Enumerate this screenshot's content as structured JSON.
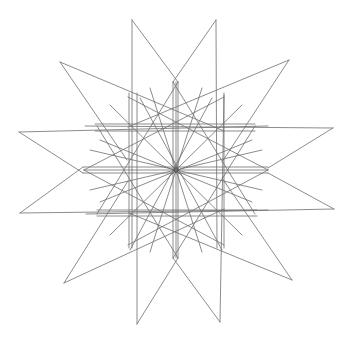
{
  "figure": {
    "width": 352,
    "height": 341,
    "background": "#ffffff",
    "stroke": "#6e6e6e",
    "stroke_dark": "#4a4a4a",
    "stroke_width": 0.8,
    "center": [
      176,
      170
    ],
    "center_circle_radius": 2.2,
    "outer_tips": [
      [
        132,
        20
      ],
      [
        216,
        20
      ],
      [
        289,
        60
      ],
      [
        333,
        128
      ],
      [
        334,
        209
      ],
      [
        292,
        280
      ],
      [
        220,
        322
      ],
      [
        137,
        324
      ],
      [
        64,
        283
      ],
      [
        20,
        213
      ],
      [
        19,
        132
      ],
      [
        60,
        62
      ]
    ],
    "lines": [
      [
        132,
        20,
        132,
        248
      ],
      [
        132,
        20,
        178,
        82
      ],
      [
        216,
        20,
        217,
        248
      ],
      [
        216,
        20,
        173,
        82
      ],
      [
        60,
        62,
        224,
        131
      ],
      [
        60,
        62,
        127,
        160
      ],
      [
        289,
        60,
        128,
        127
      ],
      [
        289,
        60,
        222,
        162
      ],
      [
        19,
        132,
        268,
        126
      ],
      [
        19,
        132,
        83,
        173
      ],
      [
        333,
        128,
        85,
        126
      ],
      [
        333,
        128,
        268,
        168
      ],
      [
        20,
        213,
        268,
        210
      ],
      [
        20,
        213,
        83,
        167
      ],
      [
        334,
        209,
        86,
        214
      ],
      [
        334,
        209,
        268,
        173
      ],
      [
        64,
        283,
        224,
        209
      ],
      [
        64,
        283,
        128,
        181
      ],
      [
        292,
        280,
        129,
        213
      ],
      [
        292,
        280,
        222,
        178
      ],
      [
        137,
        324,
        137,
        93
      ],
      [
        137,
        324,
        178,
        258
      ],
      [
        220,
        322,
        224,
        93
      ],
      [
        220,
        322,
        173,
        258
      ],
      [
        173,
        82,
        173,
        258
      ],
      [
        178,
        82,
        178,
        258
      ],
      [
        129,
        93,
        129,
        248
      ],
      [
        224,
        95,
        224,
        248
      ],
      [
        95,
        124,
        255,
        124
      ],
      [
        95,
        131,
        255,
        131
      ],
      [
        97,
        210,
        257,
        210
      ],
      [
        97,
        216,
        257,
        216
      ],
      [
        83,
        167,
        268,
        167
      ],
      [
        83,
        173,
        268,
        173
      ],
      [
        128,
        97,
        268,
        170
      ],
      [
        224,
        97,
        84,
        170
      ],
      [
        128,
        245,
        268,
        170
      ],
      [
        224,
        245,
        84,
        170
      ],
      [
        97,
        126,
        178,
        258
      ],
      [
        255,
        126,
        173,
        258
      ],
      [
        97,
        214,
        178,
        82
      ],
      [
        255,
        214,
        173,
        82
      ],
      [
        140,
        98,
        222,
        250
      ],
      [
        212,
        98,
        130,
        250
      ],
      [
        100,
        140,
        252,
        202
      ],
      [
        252,
        140,
        100,
        202
      ],
      [
        176,
        82,
        176,
        258
      ],
      [
        84,
        170,
        268,
        170
      ],
      [
        110,
        105,
        242,
        235
      ],
      [
        242,
        105,
        110,
        235
      ],
      [
        150,
        88,
        202,
        252
      ],
      [
        202,
        88,
        150,
        252
      ],
      [
        90,
        150,
        262,
        190
      ],
      [
        262,
        150,
        90,
        190
      ]
    ]
  }
}
